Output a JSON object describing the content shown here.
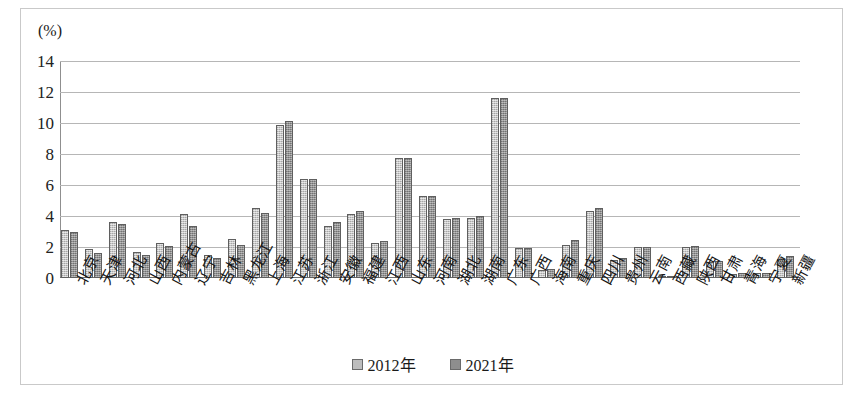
{
  "chart_data": {
    "type": "bar",
    "title": "",
    "subtitle": "",
    "unit_label": "(%)",
    "xlabel": "",
    "ylabel": "",
    "ylim": [
      0,
      14
    ],
    "ytick_step": 2,
    "yticks": [
      "14",
      "12",
      "10",
      "8",
      "6",
      "4",
      "2",
      "0"
    ],
    "grid": true,
    "legend_position": "bottom",
    "categories": [
      "北京",
      "天津",
      "河北",
      "山西",
      "内蒙古",
      "辽宁",
      "吉林",
      "黑龙江",
      "上海",
      "江苏",
      "浙江",
      "安徽",
      "福建",
      "江西",
      "山东",
      "河南",
      "湖北",
      "湖南",
      "广东",
      "广西",
      "海南",
      "重庆",
      "四川",
      "贵州",
      "云南",
      "西藏",
      "陕西",
      "甘肃",
      "青海",
      "宁夏",
      "新疆"
    ],
    "series": [
      {
        "name": "2012年",
        "color": "#bdbdbd",
        "values": [
          3.1,
          1.85,
          3.6,
          1.65,
          2.25,
          4.15,
          1.5,
          2.5,
          4.5,
          9.9,
          6.4,
          3.35,
          4.1,
          2.25,
          7.75,
          5.3,
          3.8,
          3.85,
          11.6,
          1.95,
          0.5,
          2.15,
          4.35,
          1.15,
          2.0,
          0.1,
          2.0,
          1.05,
          0.25,
          0.3,
          1.2
        ]
      },
      {
        "name": "2021年",
        "color": "#8e8e8e",
        "values": [
          3.0,
          1.6,
          3.5,
          1.5,
          2.05,
          3.35,
          1.3,
          2.1,
          4.2,
          10.15,
          6.4,
          3.6,
          4.35,
          2.4,
          7.75,
          5.3,
          3.85,
          4.0,
          11.6,
          1.95,
          0.55,
          2.45,
          4.5,
          1.3,
          2.0,
          0.12,
          2.05,
          1.1,
          0.3,
          0.35,
          1.4
        ]
      }
    ]
  },
  "legend": {
    "items": [
      {
        "label": "2012年",
        "color": "#bdbdbd"
      },
      {
        "label": "2021年",
        "color": "#8e8e8e"
      }
    ]
  }
}
